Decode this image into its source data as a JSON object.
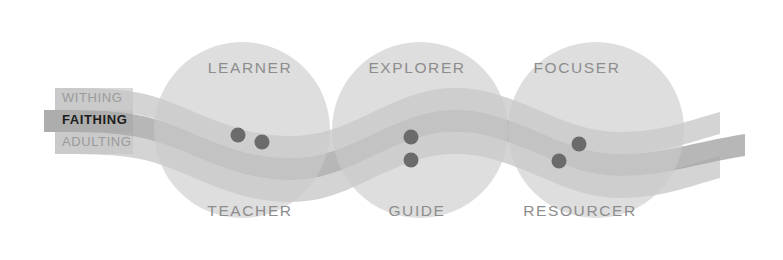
{
  "diagram": {
    "background_color": "#ffffff",
    "circle_color": "#cfcfcf",
    "band_outer_color": "#c4c4c4",
    "band_middle_color": "#a7a7a7",
    "dot_color": "#6b6b6b",
    "label_color": "#8d8d8d",
    "band_label_muted_color": "#9b9b9b",
    "band_label_strong_color": "#1c1c1c",
    "tab_color": "#d6d6d6"
  },
  "bands": [
    {
      "id": "withing",
      "label": "WITHING",
      "emphasis": "normal"
    },
    {
      "id": "faithing",
      "label": "FAITHING",
      "emphasis": "bold"
    },
    {
      "id": "adulting",
      "label": "ADULTING",
      "emphasis": "normal"
    }
  ],
  "spheres": [
    {
      "id": "sphere-1",
      "top_label": "LEARNER",
      "bottom_label": "TEACHER"
    },
    {
      "id": "sphere-2",
      "top_label": "EXPLORER",
      "bottom_label": "GUIDE"
    },
    {
      "id": "sphere-3",
      "top_label": "FOCUSER",
      "bottom_label": "RESOURCER"
    }
  ],
  "markers": [
    {
      "id": "marker-1",
      "sphere": "sphere-1",
      "band": "faithing"
    },
    {
      "id": "marker-2",
      "sphere": "sphere-1",
      "band": "adulting"
    },
    {
      "id": "marker-3",
      "sphere": "sphere-2",
      "band": "faithing"
    },
    {
      "id": "marker-4",
      "sphere": "sphere-2",
      "band": "adulting"
    },
    {
      "id": "marker-5",
      "sphere": "sphere-3",
      "band": "adulting"
    },
    {
      "id": "marker-6",
      "sphere": "sphere-3",
      "band": "faithing"
    }
  ]
}
